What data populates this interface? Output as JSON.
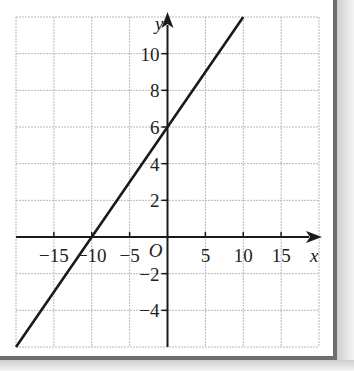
{
  "chart_data": {
    "type": "line",
    "title": "",
    "xlabel": "x",
    "ylabel": "y",
    "origin_label": "O",
    "xlim": [
      -20,
      20
    ],
    "ylim": [
      -6,
      12
    ],
    "grid": true,
    "x_grid_step": 5,
    "y_grid_step": 2,
    "x_tick_labels": [
      "−15",
      "−10",
      "−5",
      "5",
      "10",
      "15"
    ],
    "x_tick_values": [
      -15,
      -10,
      -5,
      5,
      10,
      15
    ],
    "y_tick_labels": [
      "10",
      "8",
      "6",
      "4",
      "2",
      "−2",
      "−4"
    ],
    "y_tick_values": [
      10,
      8,
      6,
      4,
      2,
      -2,
      -4
    ],
    "series": [
      {
        "name": "y = 0.6x + 6",
        "equation": "y = 0.6x + 6",
        "x": [
          -20,
          -10,
          0,
          10
        ],
        "y": [
          -6,
          0,
          6,
          12
        ]
      }
    ],
    "key_points": {
      "x_intercept": [
        -10,
        0
      ],
      "y_intercept": [
        0,
        6
      ]
    },
    "legend": "none"
  }
}
